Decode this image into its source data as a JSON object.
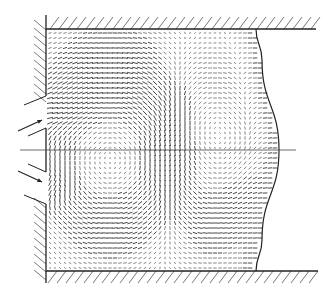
{
  "figure": {
    "type": "flow-vector-field",
    "colors": {
      "line": "#222222",
      "vector": "#333333",
      "hatch": "#555555",
      "background": "#ffffff"
    },
    "chamber": {
      "left_wall_x": 46,
      "top_wall_y": 29,
      "bottom_wall_y": 271,
      "top_wall_end_x": 316,
      "bottom_wall_end_x": 318,
      "centerline_y": 150,
      "centerline_x_start": 20,
      "centerline_x_end": 296
    },
    "inlets": [
      {
        "name": "upper-inlet",
        "y_top": 96,
        "y_bottom": 118,
        "arrow_from": [
          18,
          131
        ],
        "arrow_to": [
          42,
          120
        ]
      },
      {
        "name": "lower-inlet",
        "y_top": 182,
        "y_bottom": 204,
        "arrow_from": [
          18,
          171
        ],
        "arrow_to": [
          42,
          182
        ]
      }
    ],
    "outflow_boundary": {
      "points": [
        [
          256,
          29
        ],
        [
          262,
          60
        ],
        [
          279,
          150
        ],
        [
          262,
          240
        ],
        [
          256,
          271
        ]
      ]
    },
    "vortices": [
      {
        "cx": 110,
        "cy": 150,
        "rx": 62,
        "ry": 85,
        "strength": 1.0
      },
      {
        "cx": 210,
        "cy": 150,
        "rx": 45,
        "ry": 80,
        "strength": -0.6
      }
    ],
    "grid_spacing": 5
  }
}
